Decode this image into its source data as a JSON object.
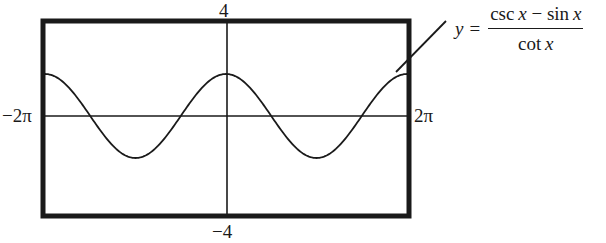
{
  "chart_data": {
    "type": "line",
    "title": "",
    "equation": {
      "lhs": "y",
      "equals": "=",
      "numerator": {
        "f1": "csc",
        "v1": "x",
        "op": " − ",
        "f2": "sin",
        "v2": "x"
      },
      "denominator": {
        "f": "cot",
        "v": "x"
      }
    },
    "xlabel": "",
    "ylabel": "",
    "xlim": [
      "-2π",
      "2π"
    ],
    "ylim": [
      -4,
      4
    ],
    "tick_labels": {
      "x_min": "−2π",
      "x_max": "2π",
      "y_max": "4",
      "y_min": "−4"
    },
    "grid": false,
    "legend": null,
    "series": [
      {
        "name": "y = (csc x − sin x) / cot x",
        "x": [
          "-2π",
          "-3π/2",
          "-π",
          "-π/2",
          "0",
          "π/2",
          "π",
          "3π/2",
          "2π"
        ],
        "values": [
          1.8,
          0,
          -1.7,
          0,
          1.8,
          0,
          -1.7,
          0,
          1.8
        ]
      }
    ]
  },
  "labels": {
    "y_max": "4",
    "y_min": "−4",
    "x_min": "−2π",
    "x_max": "2π"
  },
  "equation": {
    "lhs": "y",
    "eq": "=",
    "num_f1": "csc",
    "num_v1": "x",
    "num_op": " − ",
    "num_f2": "sin",
    "num_v2": "x",
    "den_f": "cot",
    "den_v": "x"
  },
  "colors": {
    "ink": "#1a1a1a",
    "background": "#ffffff"
  }
}
